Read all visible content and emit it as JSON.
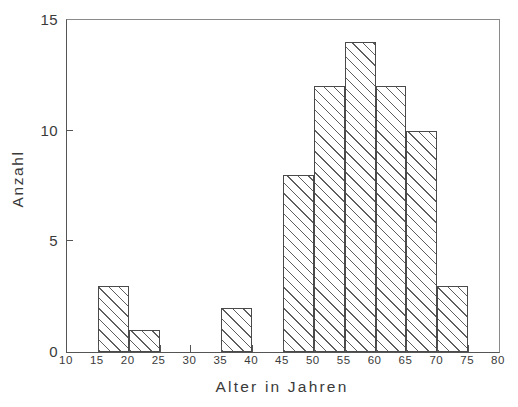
{
  "chart_data": {
    "type": "bar",
    "title": "",
    "subtitle": "",
    "xlabel": "Alter in Jahren",
    "ylabel": "Anzahl",
    "xlim": [
      10,
      80
    ],
    "ylim": [
      0,
      15
    ],
    "xticks": [
      10,
      15,
      20,
      25,
      30,
      35,
      40,
      45,
      50,
      55,
      60,
      65,
      70,
      75,
      80
    ],
    "xtick_labels": [
      "10",
      "15",
      "20",
      "25",
      "30",
      "35",
      "40",
      "45",
      "50",
      "55",
      "60",
      "65",
      "70",
      "75",
      "80"
    ],
    "yticks": [
      0,
      5,
      10,
      15
    ],
    "ytick_labels": [
      "0",
      "5",
      "10",
      "15"
    ],
    "grid": false,
    "legend": null,
    "bin_width": 5,
    "categories": [
      "10-15",
      "15-20",
      "20-25",
      "25-30",
      "30-35",
      "35-40",
      "40-45",
      "45-50",
      "50-55",
      "55-60",
      "60-65",
      "65-70",
      "70-75",
      "75-80"
    ],
    "bins": [
      {
        "from": 10,
        "to": 15,
        "value": 0
      },
      {
        "from": 15,
        "to": 20,
        "value": 3
      },
      {
        "from": 20,
        "to": 25,
        "value": 1
      },
      {
        "from": 25,
        "to": 30,
        "value": 0
      },
      {
        "from": 30,
        "to": 35,
        "value": 0
      },
      {
        "from": 35,
        "to": 40,
        "value": 2
      },
      {
        "from": 40,
        "to": 45,
        "value": 0
      },
      {
        "from": 45,
        "to": 50,
        "value": 8
      },
      {
        "from": 50,
        "to": 55,
        "value": 12
      },
      {
        "from": 55,
        "to": 60,
        "value": 14
      },
      {
        "from": 60,
        "to": 65,
        "value": 12
      },
      {
        "from": 65,
        "to": 70,
        "value": 10
      },
      {
        "from": 70,
        "to": 75,
        "value": 3
      },
      {
        "from": 75,
        "to": 80,
        "value": 0
      }
    ],
    "values": [
      0,
      3,
      1,
      0,
      0,
      2,
      0,
      8,
      12,
      14,
      12,
      10,
      3,
      0
    ],
    "style": {
      "bar_fill": "#ffffff",
      "bar_hatch": "diagonal-45",
      "bar_edge_color": "#4a4a4a",
      "hatch_color": "#5e5e5e",
      "axis_color": "#555555",
      "background": "#ffffff",
      "text_color": "#3a3a3a"
    }
  }
}
